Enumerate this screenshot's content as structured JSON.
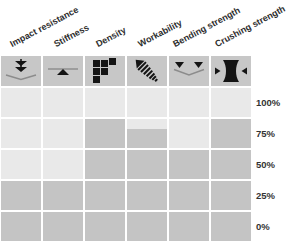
{
  "chart_data": {
    "type": "heatmap",
    "title": "",
    "columns": [
      {
        "label": "Impact resistance",
        "icon": "impact-resistance-icon"
      },
      {
        "label": "Stiffness",
        "icon": "stiffness-icon"
      },
      {
        "label": "Density",
        "icon": "density-icon"
      },
      {
        "label": "Workability",
        "icon": "workability-icon"
      },
      {
        "label": "Bending strength",
        "icon": "bending-strength-icon"
      },
      {
        "label": "Crushing strength",
        "icon": "crushing-strength-icon"
      }
    ],
    "row_labels": [
      "100%",
      "75%",
      "50%",
      "25%",
      "0%"
    ],
    "cells": [
      [
        0,
        0,
        0,
        0,
        0,
        0
      ],
      [
        0,
        0,
        1,
        0.65,
        0,
        1
      ],
      [
        0,
        0,
        1,
        1,
        1,
        1
      ],
      [
        1,
        1,
        1,
        1,
        1,
        1
      ],
      [
        1,
        1,
        1,
        1,
        1,
        1
      ]
    ],
    "series": [
      {
        "name": "Impact resistance",
        "fill_percent": 40
      },
      {
        "name": "Stiffness",
        "fill_percent": 40
      },
      {
        "name": "Density",
        "fill_percent": 80
      },
      {
        "name": "Workability",
        "fill_percent": 73
      },
      {
        "name": "Bending strength",
        "fill_percent": 60
      },
      {
        "name": "Crushing strength",
        "fill_percent": 80
      }
    ],
    "ylim": [
      0,
      100
    ],
    "legend_position": "none",
    "grid_gaps": "white",
    "colors": {
      "cell_light": "#e9e9e9",
      "cell_dark": "#c4c4c4",
      "icon_box": "#c7c7c7",
      "icon_glyph": "#141414",
      "icon_line": "#8c8c8c",
      "background": "#ffffff",
      "label_text": "#2e2e2e"
    }
  }
}
